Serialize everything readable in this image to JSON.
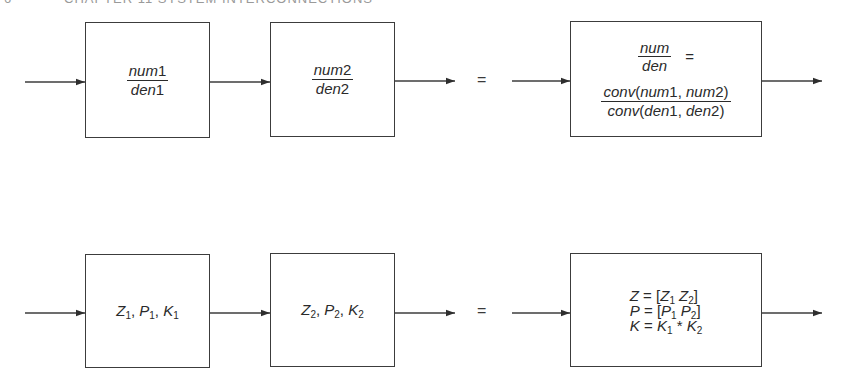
{
  "header": {
    "page_number": "6",
    "running_title": "CHAPTER 11   SYSTEM INTERCONNECTIONS"
  },
  "colors": {
    "line": "#3c3c3c",
    "text": "#2a2a2a",
    "background": "#ffffff"
  },
  "top_row": {
    "description": "Series connection of transfer functions (num/den form)",
    "block1": {
      "numerator": {
        "var": "num",
        "digit": "1"
      },
      "denominator": {
        "var": "den",
        "digit": "1"
      }
    },
    "block2": {
      "numerator": {
        "var": "num",
        "digit": "2"
      },
      "denominator": {
        "var": "den",
        "digit": "2"
      }
    },
    "equals": "=",
    "result": {
      "lhs_num": "num",
      "lhs_den": "den",
      "lhs_eq": "=",
      "rhs_num": {
        "fn": "conv",
        "open": "(",
        "a_var": "num",
        "a_digit": "1",
        "sep": ", ",
        "b_var": "num",
        "b_digit": "2",
        "close": ")"
      },
      "rhs_den": {
        "fn": "conv",
        "open": "(",
        "a_var": "den",
        "a_digit": "1",
        "sep": ", ",
        "b_var": "den",
        "b_digit": "2",
        "close": ")"
      }
    }
  },
  "bottom_row": {
    "description": "Series connection in zero-pole-gain form",
    "block1": {
      "z": "Z",
      "z_sub": "1",
      "p": "P",
      "p_sub": "1",
      "k": "K",
      "k_sub": "1",
      "sep": ", "
    },
    "block2": {
      "z": "Z",
      "z_sub": "2",
      "p": "P",
      "p_sub": "2",
      "k": "K",
      "k_sub": "2",
      "sep": ", "
    },
    "equals": "=",
    "result": {
      "line1": {
        "lhs": "Z",
        "eq": " = [",
        "a": "Z",
        "a_sub": "1",
        "space": " ",
        "b": "Z",
        "b_sub": "2",
        "close": "]"
      },
      "line2": {
        "lhs": "P",
        "eq": " = [",
        "a": "P",
        "a_sub": "1",
        "space": " ",
        "b": "P",
        "b_sub": "2",
        "close": "]"
      },
      "line3": {
        "lhs": "K",
        "eq": " = ",
        "a": "K",
        "a_sub": "1",
        "op": " * ",
        "b": "K",
        "b_sub": "2"
      }
    }
  }
}
